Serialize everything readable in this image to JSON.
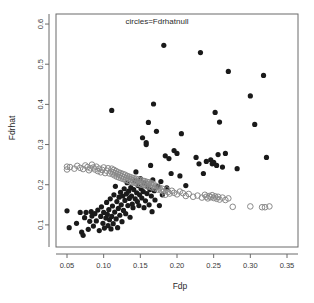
{
  "chart_data": {
    "type": "scatter",
    "title": "circles=Fdrhatnull",
    "xlabel": "Fdp",
    "ylabel": "Fdrhat",
    "xlim": [
      0.035,
      0.365
    ],
    "ylim": [
      0.045,
      0.625
    ],
    "xticks": [
      0.05,
      0.1,
      0.15,
      0.2,
      0.25,
      0.3,
      0.35
    ],
    "xticklabels": [
      "0.05",
      "0.10",
      "0.15",
      "0.20",
      "0.25",
      "0.30",
      "0.35"
    ],
    "yticks": [
      0.1,
      0.2,
      0.3,
      0.4,
      0.5,
      0.6
    ],
    "yticklabels": [
      "0.1",
      "0.2",
      "0.3",
      "0.4",
      "0.5",
      "0.6"
    ],
    "grid": false,
    "legend_position": "none",
    "box_frame": true,
    "series": [
      {
        "name": "Fdrhat",
        "marker": "filled-circle",
        "color": "#1a1a1a",
        "size": 2.6,
        "points": [
          [
            0.05,
            0.135
          ],
          [
            0.053,
            0.093
          ],
          [
            0.063,
            0.104
          ],
          [
            0.068,
            0.131
          ],
          [
            0.07,
            0.082
          ],
          [
            0.072,
            0.074
          ],
          [
            0.074,
            0.118
          ],
          [
            0.076,
            0.131
          ],
          [
            0.079,
            0.089
          ],
          [
            0.081,
            0.109
          ],
          [
            0.083,
            0.133
          ],
          [
            0.084,
            0.122
          ],
          [
            0.086,
            0.097
          ],
          [
            0.088,
            0.128
          ],
          [
            0.09,
            0.11
          ],
          [
            0.092,
            0.137
          ],
          [
            0.094,
            0.086
          ],
          [
            0.096,
            0.121
          ],
          [
            0.097,
            0.145
          ],
          [
            0.099,
            0.104
          ],
          [
            0.1,
            0.131
          ],
          [
            0.101,
            0.092
          ],
          [
            0.103,
            0.117
          ],
          [
            0.104,
            0.156
          ],
          [
            0.105,
            0.126
          ],
          [
            0.106,
            0.098
          ],
          [
            0.107,
            0.138
          ],
          [
            0.108,
            0.113
          ],
          [
            0.109,
            0.165
          ],
          [
            0.11,
            0.09
          ],
          [
            0.111,
            0.121
          ],
          [
            0.111,
            0.385
          ],
          [
            0.112,
            0.147
          ],
          [
            0.113,
            0.103
          ],
          [
            0.114,
            0.175
          ],
          [
            0.115,
            0.132
          ],
          [
            0.116,
            0.196
          ],
          [
            0.117,
            0.115
          ],
          [
            0.118,
            0.158
          ],
          [
            0.119,
            0.093
          ],
          [
            0.12,
            0.141
          ],
          [
            0.121,
            0.169
          ],
          [
            0.122,
            0.124
          ],
          [
            0.123,
            0.181
          ],
          [
            0.124,
            0.15
          ],
          [
            0.125,
            0.108
          ],
          [
            0.126,
            0.172
          ],
          [
            0.127,
            0.136
          ],
          [
            0.128,
            0.19
          ],
          [
            0.129,
            0.161
          ],
          [
            0.13,
            0.128
          ],
          [
            0.131,
            0.177
          ],
          [
            0.132,
            0.205
          ],
          [
            0.133,
            0.148
          ],
          [
            0.134,
            0.184
          ],
          [
            0.135,
            0.166
          ],
          [
            0.136,
            0.119
          ],
          [
            0.137,
            0.193
          ],
          [
            0.138,
            0.172
          ],
          [
            0.139,
            0.152
          ],
          [
            0.14,
            0.143
          ],
          [
            0.141,
            0.188
          ],
          [
            0.142,
            0.21
          ],
          [
            0.143,
            0.165
          ],
          [
            0.144,
            0.232
          ],
          [
            0.145,
            0.18
          ],
          [
            0.146,
            0.158
          ],
          [
            0.147,
            0.198
          ],
          [
            0.148,
            0.148
          ],
          [
            0.149,
            0.175
          ],
          [
            0.15,
            0.215
          ],
          [
            0.151,
            0.19
          ],
          [
            0.152,
            0.167
          ],
          [
            0.153,
            0.317
          ],
          [
            0.154,
            0.183
          ],
          [
            0.155,
            0.143
          ],
          [
            0.156,
            0.203
          ],
          [
            0.157,
            0.16
          ],
          [
            0.158,
            0.305
          ],
          [
            0.158,
            0.3
          ],
          [
            0.159,
            0.178
          ],
          [
            0.16,
            0.195
          ],
          [
            0.161,
            0.355
          ],
          [
            0.162,
            0.15
          ],
          [
            0.163,
            0.188
          ],
          [
            0.164,
            0.248
          ],
          [
            0.165,
            0.172
          ],
          [
            0.166,
            0.133
          ],
          [
            0.167,
            0.212
          ],
          [
            0.168,
            0.401
          ],
          [
            0.169,
            0.185
          ],
          [
            0.17,
            0.162
          ],
          [
            0.172,
            0.333
          ],
          [
            0.174,
            0.196
          ],
          [
            0.176,
            0.148
          ],
          [
            0.178,
            0.208
          ],
          [
            0.18,
            0.175
          ],
          [
            0.182,
            0.547
          ],
          [
            0.184,
            0.272
          ],
          [
            0.186,
            0.192
          ],
          [
            0.189,
            0.265
          ],
          [
            0.192,
            0.228
          ],
          [
            0.196,
            0.285
          ],
          [
            0.2,
            0.278
          ],
          [
            0.204,
            0.222
          ],
          [
            0.206,
            0.327
          ],
          [
            0.212,
            0.198
          ],
          [
            0.226,
            0.268
          ],
          [
            0.23,
            0.252
          ],
          [
            0.232,
            0.529
          ],
          [
            0.236,
            0.228
          ],
          [
            0.24,
            0.258
          ],
          [
            0.246,
            0.262
          ],
          [
            0.248,
            0.252
          ],
          [
            0.25,
            0.256
          ],
          [
            0.252,
            0.38
          ],
          [
            0.254,
            0.248
          ],
          [
            0.256,
            0.275
          ],
          [
            0.258,
            0.356
          ],
          [
            0.262,
            0.244
          ],
          [
            0.266,
            0.278
          ],
          [
            0.27,
            0.482
          ],
          [
            0.282,
            0.24
          ],
          [
            0.3,
            0.421
          ],
          [
            0.306,
            0.35
          ],
          [
            0.318,
            0.472
          ],
          [
            0.322,
            0.268
          ]
        ]
      },
      {
        "name": "Fdrhatnull",
        "marker": "open-circle",
        "color": "#8a8a8a",
        "size": 2.8,
        "points": [
          [
            0.05,
            0.245
          ],
          [
            0.05,
            0.238
          ],
          [
            0.054,
            0.244
          ],
          [
            0.06,
            0.24
          ],
          [
            0.064,
            0.247
          ],
          [
            0.068,
            0.242
          ],
          [
            0.072,
            0.239
          ],
          [
            0.075,
            0.248
          ],
          [
            0.078,
            0.244
          ],
          [
            0.08,
            0.236
          ],
          [
            0.082,
            0.241
          ],
          [
            0.084,
            0.25
          ],
          [
            0.086,
            0.243
          ],
          [
            0.088,
            0.238
          ],
          [
            0.09,
            0.245
          ],
          [
            0.092,
            0.234
          ],
          [
            0.094,
            0.24
          ],
          [
            0.096,
            0.231
          ],
          [
            0.098,
            0.237
          ],
          [
            0.1,
            0.243
          ],
          [
            0.102,
            0.229
          ],
          [
            0.104,
            0.235
          ],
          [
            0.106,
            0.241
          ],
          [
            0.108,
            0.228
          ],
          [
            0.11,
            0.233
          ],
          [
            0.111,
            0.24
          ],
          [
            0.112,
            0.226
          ],
          [
            0.113,
            0.231
          ],
          [
            0.114,
            0.237
          ],
          [
            0.115,
            0.223
          ],
          [
            0.116,
            0.229
          ],
          [
            0.117,
            0.234
          ],
          [
            0.118,
            0.22
          ],
          [
            0.119,
            0.226
          ],
          [
            0.12,
            0.231
          ],
          [
            0.121,
            0.218
          ],
          [
            0.122,
            0.224
          ],
          [
            0.123,
            0.229
          ],
          [
            0.124,
            0.216
          ],
          [
            0.125,
            0.221
          ],
          [
            0.126,
            0.227
          ],
          [
            0.127,
            0.214
          ],
          [
            0.128,
            0.219
          ],
          [
            0.129,
            0.225
          ],
          [
            0.13,
            0.212
          ],
          [
            0.131,
            0.217
          ],
          [
            0.132,
            0.222
          ],
          [
            0.133,
            0.21
          ],
          [
            0.134,
            0.215
          ],
          [
            0.135,
            0.22
          ],
          [
            0.136,
            0.208
          ],
          [
            0.137,
            0.213
          ],
          [
            0.138,
            0.218
          ],
          [
            0.139,
            0.206
          ],
          [
            0.14,
            0.211
          ],
          [
            0.141,
            0.216
          ],
          [
            0.142,
            0.205
          ],
          [
            0.143,
            0.21
          ],
          [
            0.144,
            0.215
          ],
          [
            0.145,
            0.203
          ],
          [
            0.146,
            0.208
          ],
          [
            0.147,
            0.213
          ],
          [
            0.148,
            0.202
          ],
          [
            0.149,
            0.207
          ],
          [
            0.15,
            0.212
          ],
          [
            0.151,
            0.2
          ],
          [
            0.152,
            0.205
          ],
          [
            0.153,
            0.21
          ],
          [
            0.154,
            0.199
          ],
          [
            0.155,
            0.204
          ],
          [
            0.156,
            0.209
          ],
          [
            0.157,
            0.198
          ],
          [
            0.158,
            0.203
          ],
          [
            0.159,
            0.207
          ],
          [
            0.16,
            0.196
          ],
          [
            0.161,
            0.201
          ],
          [
            0.162,
            0.206
          ],
          [
            0.163,
            0.195
          ],
          [
            0.164,
            0.2
          ],
          [
            0.165,
            0.204
          ],
          [
            0.166,
            0.193
          ],
          [
            0.167,
            0.198
          ],
          [
            0.168,
            0.202
          ],
          [
            0.17,
            0.191
          ],
          [
            0.172,
            0.196
          ],
          [
            0.174,
            0.188
          ],
          [
            0.176,
            0.193
          ],
          [
            0.178,
            0.186
          ],
          [
            0.18,
            0.19
          ],
          [
            0.182,
            0.183
          ],
          [
            0.184,
            0.175
          ],
          [
            0.186,
            0.188
          ],
          [
            0.188,
            0.182
          ],
          [
            0.19,
            0.178
          ],
          [
            0.193,
            0.185
          ],
          [
            0.196,
            0.18
          ],
          [
            0.2,
            0.176
          ],
          [
            0.204,
            0.183
          ],
          [
            0.208,
            0.179
          ],
          [
            0.212,
            0.172
          ],
          [
            0.216,
            0.177
          ],
          [
            0.222,
            0.17
          ],
          [
            0.228,
            0.173
          ],
          [
            0.234,
            0.168
          ],
          [
            0.238,
            0.175
          ],
          [
            0.24,
            0.17
          ],
          [
            0.242,
            0.166
          ],
          [
            0.244,
            0.172
          ],
          [
            0.246,
            0.169
          ],
          [
            0.248,
            0.174
          ],
          [
            0.25,
            0.167
          ],
          [
            0.252,
            0.171
          ],
          [
            0.254,
            0.165
          ],
          [
            0.256,
            0.17
          ],
          [
            0.258,
            0.163
          ],
          [
            0.262,
            0.168
          ],
          [
            0.266,
            0.162
          ],
          [
            0.27,
            0.166
          ],
          [
            0.276,
            0.145
          ],
          [
            0.3,
            0.146
          ],
          [
            0.316,
            0.144
          ],
          [
            0.32,
            0.144
          ],
          [
            0.326,
            0.146
          ]
        ]
      }
    ]
  }
}
